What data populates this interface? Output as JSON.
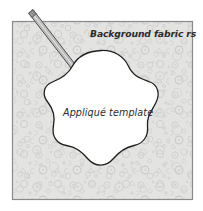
{
  "figure": {
    "type": "illustration",
    "canvas": {
      "width": 203,
      "height": 211,
      "background": "#ffffff"
    }
  },
  "fabric": {
    "name": "background-fabric-square",
    "label": "Background fabric rs",
    "fill": "#e3e3e1",
    "border_color": "#8a8a8a",
    "motif_color": "#cfcfcd",
    "bounds": {
      "x": 12,
      "y": 21,
      "width": 181,
      "height": 179
    }
  },
  "template": {
    "name": "applique-template-shape",
    "label": "Appliqué template",
    "fill": "#ffffff",
    "outline_color": "#1f1f1f",
    "petals": 5
  },
  "marking_tool": {
    "name": "marking-pencil",
    "body_color": "#b6b6b6",
    "outline_color": "#4f4f4f",
    "tip_color": "#8d8d8d",
    "from": {
      "x": 30,
      "y": 12
    },
    "to": {
      "x": 79,
      "y": 76
    }
  },
  "colors": {
    "fabric_fill": "#e3e3e1",
    "fabric_motif": "#cfcfcd",
    "fabric_border": "#8a8a8a",
    "template_fill": "#ffffff",
    "template_outline": "#1f1f1f",
    "text": "#2b2b2b",
    "pencil": "#b6b6b6"
  }
}
